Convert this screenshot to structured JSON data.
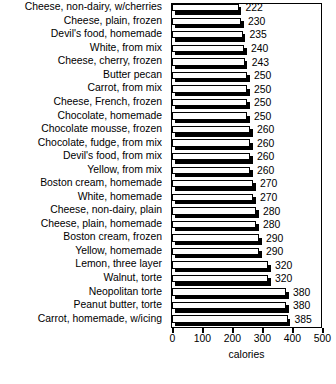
{
  "chart_data": {
    "type": "bar",
    "orientation": "horizontal",
    "title": "",
    "xlabel": "calories",
    "ylabel": "",
    "xlim": [
      0,
      500
    ],
    "xticks": [
      0,
      100,
      200,
      300,
      400,
      500
    ],
    "xtick_labels": [
      "0",
      "100",
      "200",
      "300",
      "400",
      "500"
    ],
    "grid": false,
    "legend": false,
    "value_labels_shown": true,
    "categories": [
      "Cheese, non-dairy, w/cherries",
      "Cheese, plain, frozen",
      "Devil's food, homemade",
      "White, from mix",
      "Cheese, cherry, frozen",
      "Butter pecan",
      "Carrot, from mix",
      "Cheese, French, frozen",
      "Chocolate, homemade",
      "Chocolate mousse, frozen",
      "Chocolate, fudge, from mix",
      "Devil's food, from mix",
      "Yellow, from mix",
      "Boston cream, homemade",
      "White, homemade",
      "Cheese, non-dairy, plain",
      "Cheese, plain, homemade",
      "Boston cream, frozen",
      "Yellow, homemade",
      "Lemon, three layer",
      "Walnut, torte",
      "Neopolitan torte",
      "Peanut butter, torte",
      "Carrot, homemade, w/icing"
    ],
    "values": [
      222,
      230,
      235,
      240,
      243,
      250,
      250,
      250,
      250,
      260,
      260,
      260,
      260,
      270,
      270,
      280,
      280,
      290,
      290,
      320,
      320,
      380,
      380,
      385
    ],
    "value_label_texts": [
      "222",
      "230",
      "235",
      "240",
      "243",
      "250",
      "250",
      "250",
      "250",
      "260",
      "260",
      "260",
      "260",
      "270",
      "270",
      "280",
      "280",
      "290",
      "290",
      "320",
      "320",
      "380",
      "380",
      "385"
    ],
    "colors": {
      "bar_face": "#ffffff",
      "bar_edge": "#000000",
      "bar_shadow": "#000000",
      "axis": "#000000",
      "text": "#000000",
      "background": "#ffffff"
    }
  }
}
